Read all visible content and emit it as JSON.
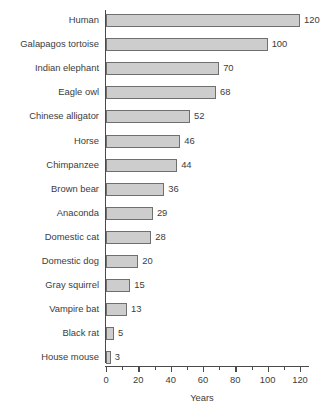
{
  "chart_data": {
    "type": "bar",
    "orientation": "horizontal",
    "title": "",
    "xlabel": "Years",
    "ylabel": "",
    "xlim": [
      0,
      120
    ],
    "grid": false,
    "legend": null,
    "bar_color": "#cdcdcd",
    "bar_border_color": "#6f6f6f",
    "axis_color": "#4a4a4a",
    "background": "#ffffff",
    "show_value_labels": true,
    "x_major_ticks": [
      0,
      20,
      40,
      60,
      80,
      100,
      120
    ],
    "x_minor_ticks": [
      10,
      30,
      50,
      70,
      90,
      110
    ],
    "x_tick_labels": [
      "0",
      "20",
      "40",
      "60",
      "80",
      "100",
      "120"
    ],
    "categories": [
      "Human",
      "Galapagos tortoise",
      "Indian elephant",
      "Eagle owl",
      "Chinese alligator",
      "Horse",
      "Chimpanzee",
      "Brown bear",
      "Anaconda",
      "Domestic cat",
      "Domestic dog",
      "Gray squirrel",
      "Vampire bat",
      "Black rat",
      "House mouse"
    ],
    "values": [
      120,
      100,
      70,
      68,
      52,
      46,
      44,
      36,
      29,
      28,
      20,
      15,
      13,
      5,
      3
    ],
    "value_labels": [
      "120",
      "100",
      "70",
      "68",
      "52",
      "46",
      "44",
      "36",
      "29",
      "28",
      "20",
      "15",
      "13",
      "5",
      "3"
    ]
  }
}
